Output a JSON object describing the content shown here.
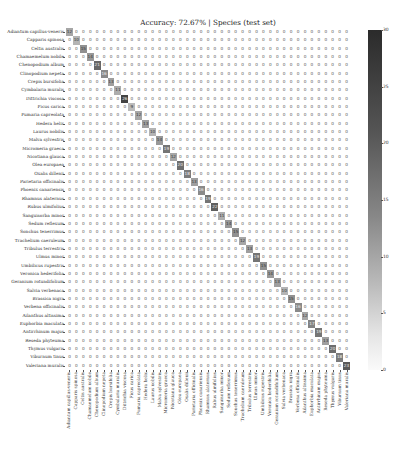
{
  "chart_data": {
    "type": "heatmap",
    "title": "Accuracy: 72.67% | Species (test set)",
    "xlabel": "",
    "ylabel": "",
    "colormap": "Greys",
    "vmin": 0,
    "vmax": 30,
    "colorbar_ticks": [
      "30",
      "25",
      "20",
      "15",
      "10",
      "5",
      "0"
    ],
    "labels": [
      "Adiantum capillus-veneris",
      "Capparis spinosa",
      "Celtis australis",
      "Chamaemelum nobile",
      "Chenopodium album",
      "Clinopodium nepeta",
      "Crepis bursifolia",
      "Cymbalaria muralis",
      "Dittrichia viscosa",
      "Ficus carica",
      "Fumaria capreolata",
      "Hedera helix",
      "Laurus nobilis",
      "Malva sylvestris",
      "Micromeria graeca",
      "Nicotiana glauca",
      "Olea europaea",
      "Oxalis dillenii",
      "Parietaria officinalis",
      "Phoenix canariensis",
      "Rhamnus alaternus",
      "Rubus ulmifolius",
      "Sanguisorba minor",
      "Sedum reflexum",
      "Sonchus tenerrimus",
      "Trachelium caeruleum",
      "Tribulus terrestris",
      "Ulmus minor",
      "Umbilicus rupestris",
      "Veronica hederifolia",
      "Geranium rotundifolium",
      "Salvia verbenaca",
      "Brassica nigra",
      "Verbena officinalis",
      "Ailanthus altissima",
      "Euphorbia maculata",
      "Antirrhinum majus",
      "Reseda phyteuma",
      "Thymus vulgaris",
      "Viburnum tinus",
      "Valeriana muralis"
    ],
    "diagonal": [
      12,
      10,
      15,
      14,
      21,
      16,
      13,
      11,
      26,
      9,
      12,
      13,
      10,
      14,
      19,
      12,
      20,
      18,
      13,
      16,
      19,
      22,
      11,
      14,
      15,
      12,
      13,
      19,
      15,
      14,
      13,
      10,
      15,
      16,
      12,
      17,
      19,
      13,
      20,
      18,
      23
    ],
    "notable_offdiag": [
      {
        "row": "Dittrichia viscosa",
        "values": "2 at col 6"
      },
      {
        "row": "Salvia verbenaca",
        "values": "3, 4 at cols 6-7"
      },
      {
        "row": "Viburnum tinus",
        "values": "3 at col 2; 8 at col 14"
      },
      {
        "row": "Rubus ulmifolius",
        "values": "2 at col 2"
      },
      {
        "row": "Veronica hederifolia",
        "values": "2 at col 2"
      }
    ]
  }
}
